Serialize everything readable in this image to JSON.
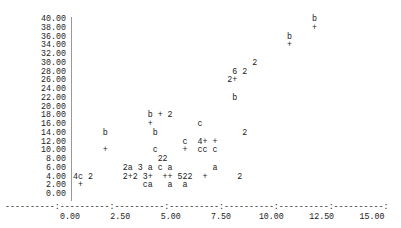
{
  "chart_data": {
    "type": "scatter",
    "title": "",
    "xlabel": "",
    "ylabel": "",
    "style": "line-printer character plot (symbols: + b c a 2 3 4 5 6 denote overlapping/labelled points)",
    "xlim": [
      0,
      15
    ],
    "ylim": [
      0,
      40
    ],
    "x_ticks": [
      "0.00",
      "2.50",
      "5.00",
      "7.50",
      "10.00",
      "12.50",
      "15.00"
    ],
    "y_ticks": [
      "40.00",
      "38.00",
      "36.00",
      "34.00",
      "32.00",
      "30.00",
      "28.00",
      "26.00",
      "24.00",
      "22.00",
      "20.00",
      "18.00",
      "16.00",
      "14.00",
      "12.00",
      "10.00",
      "8.00",
      "6.00",
      "4.00",
      "2.00",
      "0.00"
    ],
    "grid": false,
    "axis_line": "----------:----------:----------:----------:----------:----------:----------:",
    "rows": [
      {
        "y": "40.00",
        "text": "                                                b"
      },
      {
        "y": "38.00",
        "text": "                                                +"
      },
      {
        "y": "36.00",
        "text": "                                           b"
      },
      {
        "y": "34.00",
        "text": "                                           +"
      },
      {
        "y": "32.00",
        "text": ""
      },
      {
        "y": "30.00",
        "text": "                                    2"
      },
      {
        "y": "28.00",
        "text": "                                6 2"
      },
      {
        "y": "26.00",
        "text": "                               2+"
      },
      {
        "y": "24.00",
        "text": ""
      },
      {
        "y": "22.00",
        "text": "                                b"
      },
      {
        "y": "20.00",
        "text": ""
      },
      {
        "y": "18.00",
        "text": "               b + 2"
      },
      {
        "y": "16.00",
        "text": "               +         c"
      },
      {
        "y": "14.00",
        "text": "      b         b                 2"
      },
      {
        "y": "12.00",
        "text": "                      c  4+ +"
      },
      {
        "y": "10.00",
        "text": "      +         c     +  cc c"
      },
      {
        "y": "8.00",
        "text": "                 22"
      },
      {
        "y": "6.00",
        "text": "          2a 3 a c a        a"
      },
      {
        "y": "4.00",
        "text": "4c 2      2+2 3+  ++ 522  +      2"
      },
      {
        "y": "2.00",
        "text": " +            ca   a  a"
      },
      {
        "y": "0.00",
        "text": ""
      }
    ],
    "points_approx": [
      {
        "x": 11.9,
        "y": 40,
        "sym": "b"
      },
      {
        "x": 11.9,
        "y": 38,
        "sym": "+"
      },
      {
        "x": 10.7,
        "y": 36,
        "sym": "b"
      },
      {
        "x": 10.7,
        "y": 34,
        "sym": "+"
      },
      {
        "x": 9.1,
        "y": 30,
        "sym": "2"
      },
      {
        "x": 8.1,
        "y": 28,
        "sym": "6"
      },
      {
        "x": 8.6,
        "y": 28,
        "sym": "2"
      },
      {
        "x": 7.9,
        "y": 26,
        "sym": "2"
      },
      {
        "x": 8.1,
        "y": 26,
        "sym": "+"
      },
      {
        "x": 8.1,
        "y": 22,
        "sym": "b"
      },
      {
        "x": 3.9,
        "y": 18,
        "sym": "b"
      },
      {
        "x": 4.4,
        "y": 18,
        "sym": "+"
      },
      {
        "x": 4.9,
        "y": 18,
        "sym": "2"
      },
      {
        "x": 3.9,
        "y": 16,
        "sym": "+"
      },
      {
        "x": 6.4,
        "y": 16,
        "sym": "c"
      },
      {
        "x": 1.6,
        "y": 14,
        "sym": "b"
      },
      {
        "x": 4.1,
        "y": 14,
        "sym": "b"
      },
      {
        "x": 8.6,
        "y": 14,
        "sym": "2"
      },
      {
        "x": 5.6,
        "y": 12,
        "sym": "c"
      },
      {
        "x": 6.4,
        "y": 12,
        "sym": "4"
      },
      {
        "x": 6.6,
        "y": 12,
        "sym": "+"
      },
      {
        "x": 7.1,
        "y": 12,
        "sym": "+"
      },
      {
        "x": 1.6,
        "y": 10,
        "sym": "+"
      },
      {
        "x": 4.1,
        "y": 10,
        "sym": "c"
      },
      {
        "x": 5.6,
        "y": 10,
        "sym": "+"
      },
      {
        "x": 6.4,
        "y": 10,
        "sym": "c"
      },
      {
        "x": 6.6,
        "y": 10,
        "sym": "c"
      },
      {
        "x": 7.1,
        "y": 10,
        "sym": "c"
      },
      {
        "x": 4.4,
        "y": 8,
        "sym": "2"
      },
      {
        "x": 4.6,
        "y": 8,
        "sym": "2"
      },
      {
        "x": 2.6,
        "y": 6,
        "sym": "2"
      },
      {
        "x": 2.9,
        "y": 6,
        "sym": "a"
      },
      {
        "x": 3.4,
        "y": 6,
        "sym": "3"
      },
      {
        "x": 3.9,
        "y": 6,
        "sym": "a"
      },
      {
        "x": 4.4,
        "y": 6,
        "sym": "c"
      },
      {
        "x": 4.9,
        "y": 6,
        "sym": "a"
      },
      {
        "x": 6.9,
        "y": 6,
        "sym": "a"
      },
      {
        "x": 0.1,
        "y": 4,
        "sym": "4"
      },
      {
        "x": 0.4,
        "y": 4,
        "sym": "c"
      },
      {
        "x": 0.9,
        "y": 4,
        "sym": "2"
      },
      {
        "x": 2.6,
        "y": 4,
        "sym": "2"
      },
      {
        "x": 2.9,
        "y": 4,
        "sym": "+"
      },
      {
        "x": 3.1,
        "y": 4,
        "sym": "2"
      },
      {
        "x": 3.6,
        "y": 4,
        "sym": "3"
      },
      {
        "x": 3.9,
        "y": 4,
        "sym": "+"
      },
      {
        "x": 4.6,
        "y": 4,
        "sym": "+"
      },
      {
        "x": 4.9,
        "y": 4,
        "sym": "+"
      },
      {
        "x": 5.4,
        "y": 4,
        "sym": "5"
      },
      {
        "x": 5.6,
        "y": 4,
        "sym": "2"
      },
      {
        "x": 5.9,
        "y": 4,
        "sym": "2"
      },
      {
        "x": 6.6,
        "y": 4,
        "sym": "+"
      },
      {
        "x": 8.4,
        "y": 4,
        "sym": "2"
      },
      {
        "x": 0.4,
        "y": 2,
        "sym": "+"
      },
      {
        "x": 3.6,
        "y": 2,
        "sym": "c"
      },
      {
        "x": 3.9,
        "y": 2,
        "sym": "a"
      },
      {
        "x": 4.9,
        "y": 2,
        "sym": "a"
      },
      {
        "x": 5.6,
        "y": 2,
        "sym": "a"
      }
    ]
  }
}
